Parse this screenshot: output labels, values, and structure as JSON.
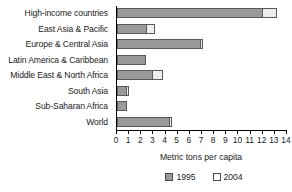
{
  "chart_data": {
    "type": "bar",
    "orientation": "horizontal",
    "title": "",
    "xlabel": "Metric tons per capita",
    "ylabel": "",
    "xlim": [
      0,
      14
    ],
    "xticks": [
      0,
      1,
      2,
      3,
      4,
      5,
      6,
      7,
      8,
      9,
      10,
      11,
      12,
      13,
      14
    ],
    "grid": false,
    "legend_position": "bottom-center",
    "categories": [
      "High-income countries",
      "East Asia & Pacific",
      "Europe & Central Asia",
      "Latin America & Caribbean",
      "Middle East & North Africa",
      "South Asia",
      "Sub-Saharan Africa",
      "World"
    ],
    "series": [
      {
        "name": "1995",
        "color": "#9a9a9a",
        "values": [
          12.0,
          2.5,
          6.9,
          2.4,
          3.0,
          0.85,
          0.85,
          4.4
        ]
      },
      {
        "name": "2004",
        "color": "#ededed",
        "values": [
          13.2,
          3.1,
          7.1,
          2.4,
          3.8,
          1.0,
          0.85,
          4.5
        ]
      }
    ]
  },
  "legend": {
    "items": [
      {
        "label": "1995",
        "swatch": "filled-gray-swatch"
      },
      {
        "label": "2004",
        "swatch": "outlined-white-swatch"
      }
    ]
  },
  "axis": {
    "x_title": "Metric tons per capita"
  }
}
